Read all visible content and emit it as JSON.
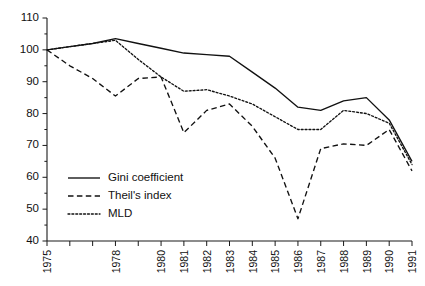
{
  "chart_data": {
    "type": "line",
    "title": "",
    "xlabel": "",
    "ylabel": "",
    "x": [
      1975,
      1976,
      1977,
      1978,
      1979,
      1980,
      1981,
      1982,
      1983,
      1984,
      1985,
      1986,
      1987,
      1988,
      1989,
      1990,
      1991
    ],
    "xtick_labels": [
      "1975",
      "",
      "",
      "1978",
      "",
      "1980",
      "1981",
      "1982",
      "1983",
      "1984",
      "1985",
      "1986",
      "1987",
      "1988",
      "1989",
      "1990",
      "1991"
    ],
    "ytick_labels": [
      "40",
      "50",
      "60",
      "70",
      "80",
      "90",
      "100",
      "110"
    ],
    "yticks": [
      40,
      50,
      60,
      70,
      80,
      90,
      100,
      110
    ],
    "ylim": [
      40,
      110
    ],
    "xlim": [
      1975,
      1991
    ],
    "grid": false,
    "legend_position": "lower-left-inside",
    "series": [
      {
        "name": "Gini coefficient",
        "style": "solid",
        "values": [
          100,
          101,
          102,
          103.5,
          102,
          100.5,
          99,
          98.5,
          98,
          93,
          88,
          82,
          81,
          84,
          85,
          78,
          65
        ]
      },
      {
        "name": "Theil's index",
        "style": "dashed",
        "values": [
          100,
          95,
          91,
          85.5,
          91,
          91.5,
          74,
          81,
          83,
          76,
          66,
          47,
          69,
          70.5,
          70,
          75,
          62
        ]
      },
      {
        "name": "MLD",
        "style": "dotted",
        "values": [
          100,
          101,
          102,
          103,
          97,
          91.5,
          87,
          87.5,
          85.5,
          83,
          79,
          75,
          75,
          81,
          80,
          77,
          64
        ]
      }
    ]
  },
  "legend": {
    "items": [
      {
        "label": "Gini coefficient",
        "style": "solid"
      },
      {
        "label": "Theil's index",
        "style": "dashed"
      },
      {
        "label": "MLD",
        "style": "dotted"
      }
    ]
  }
}
